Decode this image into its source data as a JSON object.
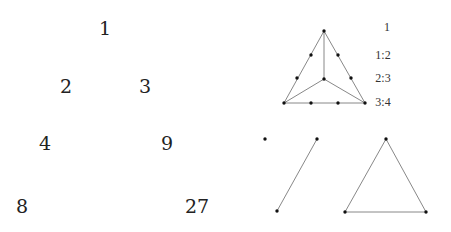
{
  "pascal_like_triangle": {
    "entries": [
      {
        "label": "1",
        "x": 105,
        "y": 28
      },
      {
        "label": "2",
        "x": 66,
        "y": 86
      },
      {
        "label": "3",
        "x": 145,
        "y": 86
      },
      {
        "label": "4",
        "x": 45,
        "y": 143
      },
      {
        "label": "9",
        "x": 167,
        "y": 143
      },
      {
        "label": "8",
        "x": 22,
        "y": 206
      },
      {
        "label": "27",
        "x": 197,
        "y": 206
      }
    ]
  },
  "subdivided_triangle": {
    "ratios": [
      {
        "label": "1",
        "x": 387,
        "y": 27
      },
      {
        "label": "1:2",
        "x": 383,
        "y": 55
      },
      {
        "label": "2:3",
        "x": 383,
        "y": 78
      },
      {
        "label": "3:4",
        "x": 383,
        "y": 102
      }
    ],
    "vertices": {
      "apex": [
        324,
        31
      ],
      "left": [
        284,
        103
      ],
      "right": [
        365,
        103
      ],
      "center": [
        324,
        79
      ]
    },
    "edge_points": [
      [
        311,
        55
      ],
      [
        297,
        78
      ],
      [
        338,
        55
      ],
      [
        351,
        78
      ],
      [
        311,
        103
      ],
      [
        338,
        103
      ]
    ]
  },
  "simplices": {
    "point": [
      265,
      139
    ],
    "segment": [
      [
        317,
        139
      ],
      [
        277,
        211
      ]
    ],
    "triangle": [
      [
        386,
        139
      ],
      [
        345,
        212
      ],
      [
        426,
        212
      ]
    ]
  },
  "colors": {
    "line": "#888888",
    "dot": "#111111",
    "text": "#222222"
  }
}
